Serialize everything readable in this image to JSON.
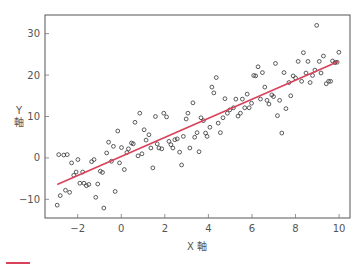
{
  "chart_data": {
    "type": "scatter",
    "title": "",
    "xlabel": "X 軸",
    "ylabel_lines": [
      "Y",
      "軸"
    ],
    "xlim": [
      -3.5,
      10.5
    ],
    "ylim": [
      -14.5,
      34.5
    ],
    "xticks": [
      -2,
      0,
      2,
      4,
      6,
      8,
      10
    ],
    "yticks": [
      -10,
      0,
      10,
      20,
      30
    ],
    "xtick_labels": [
      "−2",
      "0",
      "2",
      "4",
      "6",
      "8",
      "10"
    ],
    "ytick_labels": [
      "−10",
      "0",
      "10",
      "20",
      "30"
    ],
    "grid": false,
    "marker_color": "#333333",
    "line_color": "#d9415a",
    "series": [
      {
        "name": "points",
        "kind": "scatter",
        "x": [
          -2.94,
          -2.87,
          -2.8,
          -2.64,
          -2.56,
          -2.48,
          -2.37,
          -2.28,
          -2.18,
          -2.07,
          -1.99,
          -1.9,
          -1.77,
          -1.71,
          -1.6,
          -1.49,
          -1.36,
          -1.25,
          -1.17,
          -1.08,
          -0.96,
          -0.86,
          -0.8,
          -0.67,
          -0.58,
          -0.45,
          -0.36,
          -0.28,
          -0.16,
          -0.08,
          0.01,
          0.14,
          0.26,
          0.33,
          0.47,
          0.55,
          0.63,
          0.77,
          0.85,
          0.95,
          1.05,
          1.14,
          1.27,
          1.36,
          1.45,
          1.57,
          1.65,
          1.73,
          1.86,
          1.95,
          2.08,
          2.19,
          2.28,
          2.37,
          2.46,
          2.57,
          2.68,
          2.77,
          2.85,
          2.98,
          3.06,
          3.15,
          3.29,
          3.37,
          3.48,
          3.57,
          3.66,
          3.77,
          3.87,
          3.94,
          4.07,
          4.16,
          4.25,
          4.36,
          4.45,
          4.55,
          4.67,
          4.76,
          4.87,
          4.98,
          5.15,
          5.26,
          5.36,
          5.47,
          5.56,
          5.67,
          5.78,
          5.87,
          5.98,
          6.08,
          6.17,
          6.28,
          6.39,
          6.48,
          6.59,
          6.69,
          6.78,
          6.91,
          6.99,
          7.08,
          7.17,
          7.27,
          7.37,
          7.47,
          7.56,
          7.7,
          7.78,
          7.89,
          8.0,
          8.12,
          8.28,
          8.36,
          8.48,
          8.57,
          8.67,
          8.78,
          8.89,
          8.97,
          9.09,
          9.17,
          9.28,
          9.41,
          9.52,
          9.61,
          9.7,
          9.81,
          9.91,
          9.99
        ],
        "y": [
          -11.4,
          0.8,
          -9.1,
          0.7,
          -7.8,
          0.8,
          -8.3,
          -1.2,
          -4.2,
          -3.4,
          -0.4,
          -6.1,
          -3.4,
          -6.1,
          -6.7,
          -6.4,
          -0.9,
          -0.4,
          -9.5,
          -6.3,
          -3.2,
          -3.5,
          -12.1,
          1.2,
          3.8,
          -0.8,
          2.8,
          -8.1,
          6.5,
          -1.2,
          2.5,
          -2.8,
          1.3,
          2.2,
          3.6,
          3.4,
          8.6,
          0.5,
          10.8,
          1.0,
          6.8,
          4.3,
          5.6,
          2.4,
          -2.4,
          10.0,
          3.4,
          2.4,
          2.2,
          10.8,
          9.9,
          4.0,
          3.2,
          2.4,
          4.4,
          4.6,
          1.4,
          -1.7,
          5.2,
          9.4,
          10.8,
          2.4,
          13.3,
          5.0,
          6.1,
          1.5,
          9.7,
          9.0,
          6.0,
          5.2,
          7.4,
          17.1,
          15.7,
          19.4,
          8.4,
          6.1,
          9.7,
          14.3,
          10.8,
          11.6,
          12.1,
          14.2,
          10.1,
          10.8,
          14.2,
          12.1,
          15.4,
          12.1,
          13.2,
          19.9,
          19.8,
          22.0,
          14.2,
          20.6,
          17.1,
          13.9,
          13.0,
          15.2,
          14.8,
          22.8,
          10.2,
          13.9,
          6.0,
          20.6,
          11.9,
          18.2,
          15.0,
          19.8,
          19.3,
          23.3,
          18.5,
          25.4,
          20.5,
          23.3,
          18.2,
          19.9,
          21.2,
          32.0,
          23.3,
          20.5,
          24.6,
          17.9,
          18.5,
          18.5,
          23.4,
          23.0,
          23.1,
          25.5
        ]
      },
      {
        "name": "fit",
        "kind": "line",
        "x": [
          -2.94,
          9.96
        ],
        "y": [
          -6.4,
          23.3
        ]
      }
    ],
    "legend": {
      "placement": "bottom-left",
      "entries": [
        {
          "label": "",
          "color": "#d9415a"
        }
      ]
    }
  }
}
